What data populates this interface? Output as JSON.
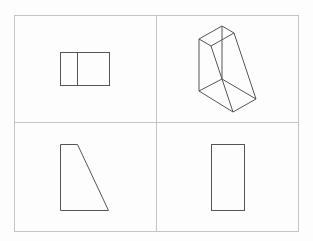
{
  "diagram": {
    "colors": {
      "background": "#fdfdfd",
      "grid_line": "#c4c4c4",
      "shape_stroke": "#555555"
    },
    "grid": {
      "outer": {
        "x": 14,
        "y": 15,
        "width": 284,
        "height": 216
      },
      "vertical_divider_x": 156,
      "horizontal_divider_y": 122
    },
    "panels": [
      {
        "name": "front-view",
        "position": "top-left",
        "shape": "rectangle-with-divider",
        "rect": {
          "x": 60,
          "y": 52,
          "width": 49,
          "height": 33
        },
        "divider_x": 77
      },
      {
        "name": "isometric-view",
        "position": "top-right",
        "shape": "wedge-prism",
        "top_face": [
          [
            199,
            39
          ],
          [
            222,
            26
          ],
          [
            234,
            33
          ],
          [
            211,
            46
          ]
        ],
        "bottom_face": [
          [
            199,
            91
          ],
          [
            222,
            79
          ],
          [
            256,
            99
          ],
          [
            233,
            112
          ]
        ]
      },
      {
        "name": "side-view",
        "position": "bottom-left",
        "shape": "trapezoid",
        "points": [
          [
            60,
            144
          ],
          [
            77,
            144
          ],
          [
            108,
            210
          ],
          [
            60,
            210
          ]
        ]
      },
      {
        "name": "top-view",
        "position": "bottom-right",
        "shape": "rectangle",
        "rect": {
          "x": 211,
          "y": 144,
          "width": 33,
          "height": 66
        }
      }
    ]
  }
}
